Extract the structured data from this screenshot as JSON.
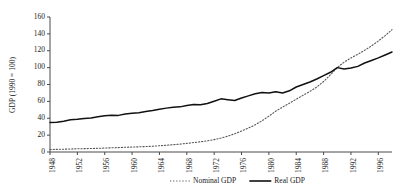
{
  "chart_data": {
    "type": "line",
    "title": "",
    "xlabel": "",
    "ylabel": "GDP (1990 = 100)",
    "ylim": [
      0,
      160
    ],
    "xlim": [
      1948,
      1998
    ],
    "grid": false,
    "legend_position": "bottom-center",
    "ytick_labels": [
      "0",
      "20",
      "40",
      "60",
      "80",
      "100",
      "120",
      "140",
      "160"
    ],
    "ytick_values": [
      0,
      20,
      40,
      60,
      80,
      100,
      120,
      140,
      160
    ],
    "xtick_labels": [
      "1948",
      "1952",
      "1956",
      "1960",
      "1964",
      "1968",
      "1972",
      "1976",
      "1980",
      "1984",
      "1988",
      "1992",
      "1996"
    ],
    "xtick_values": [
      1948,
      1952,
      1956,
      1960,
      1964,
      1968,
      1972,
      1976,
      1980,
      1984,
      1988,
      1992,
      1996
    ],
    "x": [
      1948,
      1949,
      1950,
      1951,
      1952,
      1953,
      1954,
      1955,
      1956,
      1957,
      1958,
      1959,
      1960,
      1961,
      1962,
      1963,
      1964,
      1965,
      1966,
      1967,
      1968,
      1969,
      1970,
      1971,
      1972,
      1973,
      1974,
      1975,
      1976,
      1977,
      1978,
      1979,
      1980,
      1981,
      1982,
      1983,
      1984,
      1985,
      1986,
      1987,
      1988,
      1989,
      1990,
      1991,
      1992,
      1993,
      1994,
      1995,
      1996,
      1997,
      1998
    ],
    "series": [
      {
        "name": "Nominal GDP",
        "style": "dotted",
        "color": "#555555",
        "values": [
          3.0,
          3.1,
          3.3,
          3.6,
          3.8,
          4.0,
          4.1,
          4.4,
          4.7,
          5.0,
          5.2,
          5.6,
          5.9,
          6.1,
          6.5,
          6.9,
          7.4,
          8.0,
          8.7,
          9.3,
          10.2,
          11.2,
          12.1,
          13.2,
          14.7,
          16.5,
          18.8,
          21.6,
          24.8,
          28.3,
          32.3,
          37.0,
          42.5,
          48.3,
          53.2,
          57.8,
          62.6,
          67.2,
          71.8,
          77.0,
          83.5,
          91.5,
          100.0,
          106.5,
          111.5,
          115.8,
          120.5,
          125.8,
          131.5,
          138.0,
          145.0
        ]
      },
      {
        "name": "Real GDP",
        "style": "solid",
        "color": "#111111",
        "values": [
          35.0,
          35.3,
          36.5,
          38.2,
          38.8,
          39.8,
          40.3,
          41.8,
          42.9,
          43.5,
          43.4,
          45.0,
          45.8,
          46.5,
          48.0,
          49.2,
          50.6,
          52.0,
          53.0,
          53.5,
          55.2,
          56.2,
          56.0,
          57.5,
          60.2,
          63.0,
          62.0,
          61.0,
          64.0,
          66.5,
          69.0,
          70.5,
          70.0,
          71.5,
          70.0,
          72.5,
          77.0,
          80.0,
          83.0,
          86.5,
          90.5,
          94.5,
          100.0,
          98.5,
          99.5,
          101.5,
          105.5,
          108.5,
          111.5,
          115.0,
          118.5
        ]
      }
    ]
  },
  "legend": {
    "entries": [
      {
        "label": "Nominal GDP",
        "style": "dotted"
      },
      {
        "label": "Real GDP",
        "style": "solid"
      }
    ]
  }
}
